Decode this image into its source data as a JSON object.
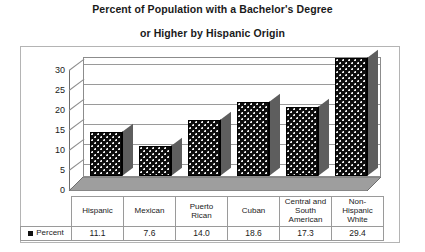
{
  "chart_data": {
    "type": "bar",
    "title": "Percent of Population with a Bachelor's Degree or Higher by Hispanic Origin",
    "title_line_1": "Percent of Population with a Bachelor's Degree",
    "title_line_2": "or Higher by Hispanic Origin",
    "xlabel": "",
    "ylabel": "",
    "categories": [
      "Hispanic",
      "Mexican",
      "Puerto Rican",
      "Cuban",
      "Central and South American",
      "Non-Hispanic White"
    ],
    "values": [
      11.1,
      7.6,
      14.0,
      18.6,
      17.3,
      29.4
    ],
    "value_labels": [
      "11.1",
      "7.6",
      "14.0",
      "18.6",
      "17.3",
      "29.4"
    ],
    "series": [
      {
        "name": "Percent",
        "values": [
          11.1,
          7.6,
          14.0,
          18.6,
          17.3,
          29.4
        ]
      }
    ],
    "ylim": [
      0,
      30
    ],
    "yticks": [
      0,
      5,
      10,
      15,
      20,
      25,
      30
    ],
    "ytick_labels": [
      "0",
      "5",
      "10",
      "15",
      "20",
      "25",
      "30"
    ],
    "grid": true,
    "legend_position": "bottom-table",
    "style": "3d-column",
    "bar_color": "#0d0d0d",
    "bar_pattern": "white-dots",
    "floor_color": "#9e9e9e",
    "frame_color": "#b4b4b4"
  },
  "table": {
    "legend_label": "Percent",
    "legend_swatch_color": "#111111",
    "category_cells": [
      {
        "lines": [
          "Hispanic"
        ]
      },
      {
        "lines": [
          "Mexican"
        ]
      },
      {
        "lines": [
          "Puerto",
          "Rican"
        ]
      },
      {
        "lines": [
          "Cuban"
        ]
      },
      {
        "lines": [
          "Central and",
          "South",
          "American"
        ]
      },
      {
        "lines": [
          "Non-",
          "Hispanic",
          "White"
        ]
      }
    ]
  }
}
